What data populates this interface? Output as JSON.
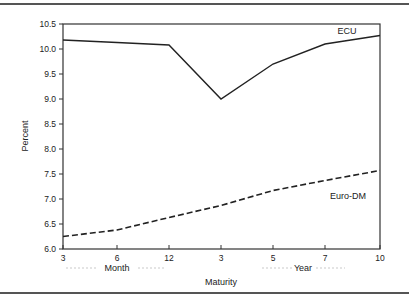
{
  "chart_data": {
    "type": "line",
    "title": "",
    "xlabel": "Maturity",
    "ylabel": "Percent",
    "x_group_labels": [
      "Month",
      "Year"
    ],
    "categories": [
      "3",
      "6",
      "12",
      "3",
      "5",
      "7",
      "10"
    ],
    "category_units": [
      "Month",
      "Month",
      "Month",
      "Year",
      "Year",
      "Year",
      "Year"
    ],
    "ylim": [
      6.0,
      10.5
    ],
    "yticks": [
      "10.5",
      "10.0",
      "9.5",
      "9.0",
      "8.5",
      "8.0",
      "7.5",
      "7.0",
      "6.5",
      "6.0"
    ],
    "grid": false,
    "series": [
      {
        "name": "ECU",
        "style": "solid",
        "values": [
          10.18,
          10.13,
          10.08,
          9.0,
          9.7,
          10.1,
          10.27
        ]
      },
      {
        "name": "Euro-DM",
        "style": "dashed",
        "values": [
          6.25,
          6.38,
          6.63,
          6.87,
          7.17,
          7.37,
          7.57
        ]
      }
    ]
  }
}
